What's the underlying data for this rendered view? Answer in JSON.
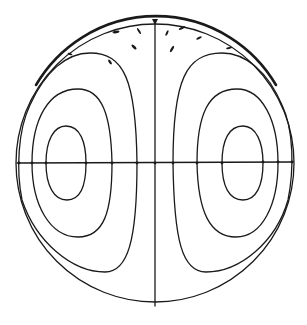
{
  "diagram": {
    "type": "streamline-circulation",
    "colors": {
      "background": "#ffffff",
      "line": "#1a1a1a"
    },
    "circle": {
      "cx": 155,
      "cy": 163,
      "r": 139
    },
    "axes": {
      "vertical": {
        "x": 155,
        "y1": 19,
        "y2": 306
      },
      "horizontal": {
        "y": 163,
        "x1": 17,
        "x2": 293
      }
    },
    "left_cell": {
      "contours": [
        {
          "level": "inner",
          "x_range": [
            46,
            86
          ],
          "y_range": [
            126,
            200
          ]
        },
        {
          "level": "middle",
          "x_range": [
            32,
            112
          ],
          "y_range": [
            89,
            237
          ]
        },
        {
          "level": "outer",
          "x_range": [
            20,
            137
          ],
          "y_range": [
            53,
            272
          ]
        }
      ]
    },
    "right_cell": {
      "contours": [
        {
          "level": "inner",
          "x_range": [
            222,
            263
          ],
          "y_range": [
            126,
            200
          ]
        },
        {
          "level": "middle",
          "x_range": [
            197,
            278
          ],
          "y_range": [
            89,
            237
          ]
        },
        {
          "level": "outer",
          "x_range": [
            173,
            291
          ],
          "y_range": [
            53,
            272
          ]
        }
      ]
    },
    "axis_crossing_marks_x": [
      17,
      32,
      46,
      86,
      112,
      137,
      155,
      173,
      197,
      222,
      263,
      278,
      292
    ],
    "top_flow_marks": 11,
    "labels": []
  }
}
